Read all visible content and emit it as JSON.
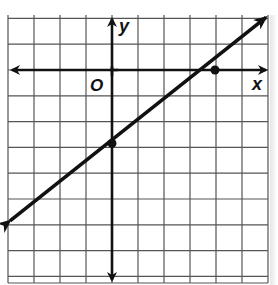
{
  "graph": {
    "labels": {
      "x_axis": "x",
      "y_axis": "y",
      "origin": "O"
    },
    "grid": {
      "x_min": -4,
      "x_max": 6,
      "y_min": -8,
      "y_max": 2,
      "step": 1
    },
    "line": {
      "slope": 0.75,
      "y_intercept": -3,
      "points": [
        {
          "x": 0,
          "y": -3
        },
        {
          "x": 4,
          "y": 0
        }
      ],
      "arrows": "both"
    },
    "colors": {
      "grid": "#555555",
      "axis": "#111111",
      "line": "#111111",
      "background": "#ffffff"
    }
  }
}
